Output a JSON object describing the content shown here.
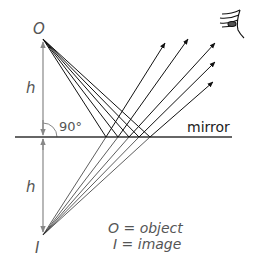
{
  "diagram": {
    "labels": {
      "object_point": "O",
      "image_point": "I",
      "height_top": "h",
      "height_bottom": "h",
      "angle": "90°",
      "mirror": "mirror",
      "legend_object": "O = object",
      "legend_image": "I = image"
    },
    "geometry": {
      "object": [
        43,
        39
      ],
      "image": [
        43,
        235
      ],
      "mirror_y": 137,
      "mirror_x": [
        15,
        232
      ],
      "reflection_x": [
        106,
        118,
        129,
        139,
        150
      ],
      "arrow_tips": [
        [
          165,
          43
        ],
        [
          188,
          39
        ],
        [
          215,
          43
        ],
        [
          215,
          62
        ],
        [
          213,
          82
        ]
      ]
    },
    "icons": {
      "eye": "eye-icon"
    },
    "colors": {
      "rays": "#111111",
      "virtual_rays": "#333333",
      "axis": "#888888",
      "text": "#555555"
    }
  }
}
